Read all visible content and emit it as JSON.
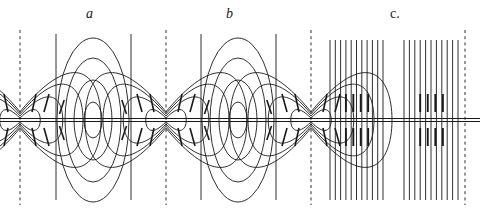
{
  "figure": {
    "background": "#ffffff",
    "ink_color": "#1a1a1a",
    "width": 484,
    "height": 219
  },
  "labels": [
    {
      "id": "a",
      "text": "a",
      "x": 88,
      "y": 8,
      "italic": true
    },
    {
      "id": "b",
      "text": "b",
      "x": 228,
      "y": 8,
      "italic": true
    },
    {
      "id": "c",
      "text": "c.",
      "x": 392,
      "y": 8,
      "italic": false
    }
  ],
  "axis": {
    "name": "wire-axis",
    "y": 120,
    "x_start": 0,
    "x_end": 480,
    "style": "double-line",
    "gap": 3
  },
  "vertical_lines": [
    {
      "x": 20,
      "style": "dashed",
      "y_top": 30,
      "y_bottom": 205
    },
    {
      "x": 56,
      "style": "solid",
      "y_top": 34,
      "y_bottom": 200
    },
    {
      "x": 131,
      "style": "solid",
      "y_top": 34,
      "y_bottom": 200
    },
    {
      "x": 166,
      "style": "dashed",
      "y_top": 30,
      "y_bottom": 205
    },
    {
      "x": 201,
      "style": "solid",
      "y_top": 34,
      "y_bottom": 200
    },
    {
      "x": 276,
      "style": "solid",
      "y_top": 34,
      "y_bottom": 200
    },
    {
      "x": 311,
      "style": "dashed",
      "y_top": 30,
      "y_bottom": 205
    },
    {
      "x": 465,
      "style": "dashed",
      "y_top": 30,
      "y_bottom": 205
    }
  ],
  "sections": {
    "a": {
      "name": "section-a-closed-loops",
      "description": "concentric closed oval field loops centred on the wire",
      "loop_centers_x": [
        93,
        238
      ],
      "loop_half_widths": [
        9,
        19,
        28,
        36
      ],
      "loop_half_heights": [
        18,
        40,
        62,
        82
      ]
    },
    "b": {
      "name": "section-b-split-loops",
      "description": "field loops detaching and splitting at the node",
      "node_centers_x": [
        20,
        166,
        311
      ],
      "arc_half_widths": [
        9,
        19,
        28,
        36
      ],
      "arc_half_heights": [
        18,
        40,
        62,
        82
      ]
    },
    "c": {
      "name": "section-c-compressed-lines",
      "description": "field lines compressed into near-vertical straight strands",
      "groups": [
        {
          "x_start": 330,
          "x_end": 383,
          "count": 11
        },
        {
          "x_start": 404,
          "x_end": 458,
          "count": 11
        }
      ],
      "tick_marks": {
        "count": 8,
        "length": 18
      }
    }
  },
  "arrows": {
    "name": "direction-arrow-marks",
    "description": "short tick strokes on the loops near the wire indicating field direction",
    "count": 32
  }
}
